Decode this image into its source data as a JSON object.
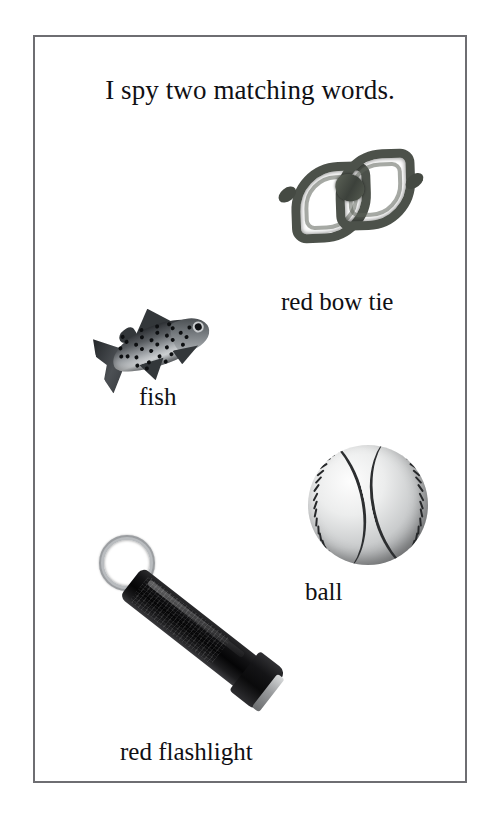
{
  "page": {
    "background_color": "#ffffff",
    "border_color": "#6e6e72",
    "text_color": "#101014"
  },
  "worksheet": {
    "title": "I spy two matching words.",
    "items": [
      {
        "id": "bowtie",
        "label": "red bow tie",
        "icon": "bow-tie-image",
        "color": "#4c514a"
      },
      {
        "id": "fish",
        "label": "fish",
        "icon": "fish-image",
        "color": "#575b5f"
      },
      {
        "id": "ball",
        "label": "ball",
        "icon": "baseball-image",
        "color": "#eceded"
      },
      {
        "id": "flashlight",
        "label": "red flashlight",
        "icon": "flashlight-image",
        "color": "#0a0a0b"
      }
    ]
  }
}
